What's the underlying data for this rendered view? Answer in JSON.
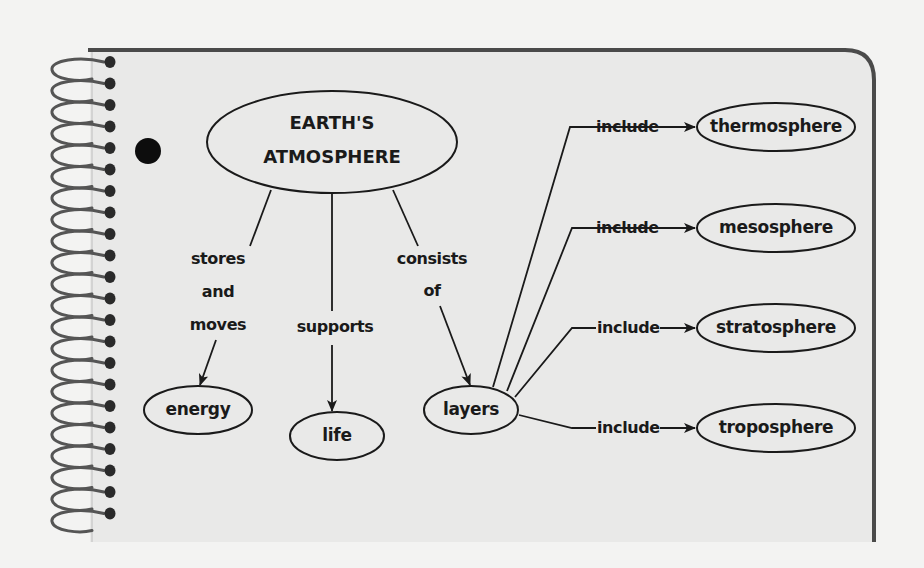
{
  "diagram": {
    "central_node": {
      "line1": "EARTH'S",
      "line2": "ATMOSPHERE"
    },
    "branches": [
      {
        "link_lines": [
          "stores",
          "and",
          "moves"
        ],
        "target": "energy"
      },
      {
        "link_lines": [
          "supports"
        ],
        "target": "life"
      },
      {
        "link_lines": [
          "consists",
          "of"
        ],
        "target": "layers"
      }
    ],
    "layers": {
      "source": "layers",
      "link_label": "include",
      "items": [
        {
          "link": "include",
          "target": "thermosphere"
        },
        {
          "link": "include",
          "target": "mesosphere"
        },
        {
          "link": "include",
          "target": "stratosphere"
        },
        {
          "link": "include",
          "target": "troposphere"
        }
      ]
    }
  },
  "colors": {
    "paper": "#e9e9e8",
    "background": "#f3f3f2",
    "ink": "#1a1a1a",
    "frame": "#4a4a4a"
  }
}
